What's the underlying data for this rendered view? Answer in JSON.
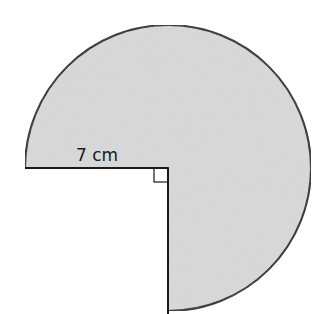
{
  "diagram": {
    "shape": "three-quarter circle (270° sector)",
    "radius_label": "7 cm",
    "right_angle_marker": true,
    "fill_color": "#d9d9d9",
    "stroke_color": "#1a1a1a"
  }
}
